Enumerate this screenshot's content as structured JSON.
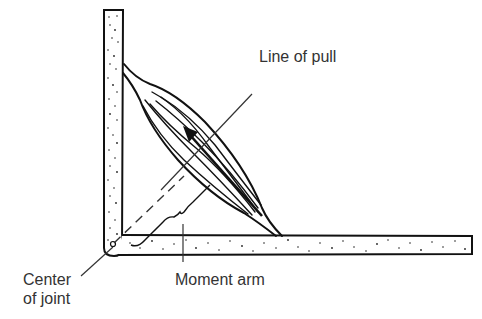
{
  "diagram": {
    "type": "anatomical-lever-diagram",
    "labels": {
      "line_of_pull": "Line of pull",
      "moment_arm": "Moment arm",
      "center_of_joint_line1": "Center",
      "center_of_joint_line2": "of joint"
    },
    "parts": [
      {
        "id": "vertical-bone",
        "description": "stippled vertical bone segment"
      },
      {
        "id": "horizontal-bone",
        "description": "stippled horizontal bone segment"
      },
      {
        "id": "muscle",
        "description": "fusiform muscle spanning both bones"
      },
      {
        "id": "force-arrow",
        "description": "arrow inside muscle pointing toward origin"
      },
      {
        "id": "moment-arm-dashed-line",
        "description": "dashed perpendicular from joint center to line of pull"
      },
      {
        "id": "moment-arm-brace",
        "description": "curly brace marking moment arm length"
      },
      {
        "id": "joint-center",
        "description": "small circle at joint"
      }
    ],
    "colors": {
      "ink": "#111111",
      "label_text": "#333333",
      "background": "#ffffff"
    }
  }
}
